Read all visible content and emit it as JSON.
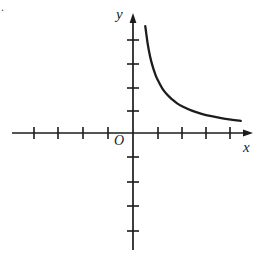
{
  "figure": {
    "background_color": "#ffffff",
    "ink_color": "#1c1c1c",
    "corner_mark": ".",
    "labels": {
      "y_axis": "y",
      "x_axis": "x",
      "origin": "O"
    }
  },
  "chart_data": {
    "type": "line",
    "title": "",
    "subtitle": "",
    "xlabel": "x",
    "ylabel": "y",
    "origin_label": "O",
    "grid": false,
    "legend": null,
    "annotations": [],
    "axes": {
      "x": {
        "min": -5,
        "max": 5,
        "tick_values": [
          -4,
          -3,
          -2,
          -1,
          1,
          2,
          3,
          4
        ],
        "tick_labels": [],
        "arrow": "right",
        "tick_spacing_units": 1
      },
      "y": {
        "min": -4,
        "max": 5,
        "tick_values": [
          -4,
          -3,
          -2,
          -1,
          1,
          2,
          3,
          4
        ],
        "tick_labels": [],
        "arrow": "up",
        "tick_spacing_units": 1
      }
    },
    "series": [
      {
        "name": "reciprocal-branch",
        "equation": "y = k / x, k > 0",
        "branch": "first-quadrant",
        "domain": [
          0.5,
          4.5
        ],
        "x": [
          0.5,
          0.6,
          0.7,
          0.8,
          0.9,
          1.0,
          1.2,
          1.4,
          1.6,
          1.8,
          2.0,
          2.4,
          2.8,
          3.2,
          3.6,
          4.0,
          4.4
        ],
        "y": [
          4.4,
          3.67,
          3.14,
          2.75,
          2.44,
          2.2,
          1.83,
          1.57,
          1.38,
          1.22,
          1.1,
          0.92,
          0.79,
          0.69,
          0.61,
          0.55,
          0.5
        ]
      }
    ]
  }
}
